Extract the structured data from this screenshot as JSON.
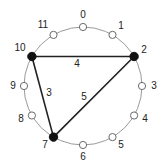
{
  "diagram": {
    "type": "pitch-class circle",
    "center": [
      83,
      86
    ],
    "radius": 59,
    "colors": {
      "circle": "#9a9a9a",
      "hollow_node_stroke": "#6a6a6a",
      "hollow_node_fill": "#ffffff",
      "filled_node": "#111111",
      "edge": "#222222",
      "text": "#222222"
    },
    "nodes": [
      {
        "id": 0,
        "label": "0",
        "filled": false,
        "x": 83.0,
        "y": 27.0,
        "lx": 83,
        "ly": 15
      },
      {
        "id": 1,
        "label": "1",
        "filled": false,
        "x": 112.5,
        "y": 34.9,
        "lx": 121,
        "ly": 26
      },
      {
        "id": 2,
        "label": "2",
        "filled": true,
        "x": 134.1,
        "y": 56.5,
        "lx": 144,
        "ly": 50
      },
      {
        "id": 3,
        "label": "3",
        "filled": false,
        "x": 142.0,
        "y": 86.0,
        "lx": 154,
        "ly": 86
      },
      {
        "id": 4,
        "label": "4",
        "filled": false,
        "x": 134.1,
        "y": 115.5,
        "lx": 145,
        "ly": 119
      },
      {
        "id": 5,
        "label": "5",
        "filled": false,
        "x": 112.5,
        "y": 137.1,
        "lx": 121,
        "ly": 145
      },
      {
        "id": 6,
        "label": "6",
        "filled": false,
        "x": 83.0,
        "y": 145.0,
        "lx": 83,
        "ly": 157
      },
      {
        "id": 7,
        "label": "7",
        "filled": true,
        "x": 53.5,
        "y": 137.1,
        "lx": 45,
        "ly": 145
      },
      {
        "id": 8,
        "label": "8",
        "filled": false,
        "x": 31.9,
        "y": 115.5,
        "lx": 21,
        "ly": 119
      },
      {
        "id": 9,
        "label": "9",
        "filled": false,
        "x": 24.0,
        "y": 86.0,
        "lx": 13,
        "ly": 86
      },
      {
        "id": 10,
        "label": "10",
        "filled": true,
        "x": 31.9,
        "y": 56.5,
        "lx": 20,
        "ly": 48
      },
      {
        "id": 11,
        "label": "11",
        "filled": false,
        "x": 53.5,
        "y": 34.9,
        "lx": 43,
        "ly": 25
      }
    ],
    "edges": [
      {
        "from": 10,
        "to": 2,
        "label": "4",
        "lx": 77,
        "ly": 64
      },
      {
        "from": 10,
        "to": 7,
        "label": "3",
        "lx": 49,
        "ly": 93
      },
      {
        "from": 7,
        "to": 2,
        "label": "5",
        "lx": 84,
        "ly": 97
      }
    ]
  }
}
